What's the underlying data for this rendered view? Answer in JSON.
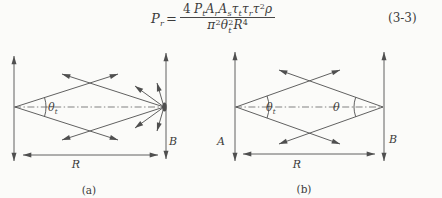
{
  "colors": {
    "ink": "#4f4f4f",
    "text": "#3b3b3b",
    "background": "#fbfbf9"
  },
  "formula": {
    "lhs_base": "P",
    "lhs_sub": "r",
    "equals": "=",
    "numerator": {
      "coef": "4",
      "f1": "P",
      "f1_sub": "t",
      "f2": "A",
      "f2_sub": "r",
      "f3": "A",
      "f3_sub": "s",
      "f4": "τ",
      "f4_sub": "t",
      "f5": "τ",
      "f5_sub": "r",
      "f6": "τ",
      "f6_sup": "2",
      "f7": "ρ"
    },
    "denominator": {
      "d1": "π",
      "d1_sup": "2",
      "d2": "θ",
      "d2_sub": "t",
      "d2_sup": "2",
      "d3": "R",
      "d3_sup": "4"
    },
    "equation_number": "(3-3)"
  },
  "diagram_a": {
    "caption": "(a)",
    "beam_angle_base": "θ",
    "beam_angle_sub": "t",
    "receiver_label": "B",
    "range_label": "R"
  },
  "diagram_b": {
    "caption": "(b)",
    "transmit_angle_base": "θ",
    "transmit_angle_sub": "t",
    "receive_angle": "θ",
    "transmitter_label": "A",
    "receiver_label": "B",
    "range_label": "R"
  }
}
